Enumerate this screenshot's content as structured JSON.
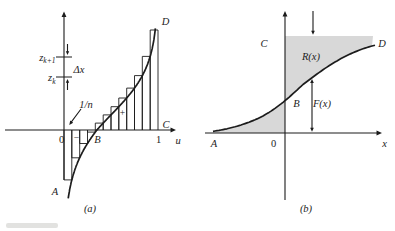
{
  "figure": {
    "panel_a": {
      "caption": "(a)",
      "x_axis_label": "u",
      "origin_label": "0",
      "unit_label": "1",
      "point_a": "A",
      "point_b": "B",
      "point_c": "C",
      "point_d": "D",
      "tick_upper": {
        "base": "z",
        "sub": "k+1"
      },
      "tick_lower": {
        "base": "z",
        "sub": "k"
      },
      "delta_label": "Δx",
      "step_width_label": "1/n",
      "plus_label": "+",
      "minus_label": "−"
    },
    "panel_b": {
      "caption": "(b)",
      "x_axis_label": "x",
      "origin_label": "0",
      "point_a": "A",
      "point_b": "B",
      "point_c": "C",
      "point_d": "D",
      "upper_region_label": "R(x)",
      "lower_region_label": "F(x)"
    },
    "colors": {
      "ink": "#1c1c1c",
      "shade": "#d8d8d8",
      "background": "#ffffff"
    }
  }
}
